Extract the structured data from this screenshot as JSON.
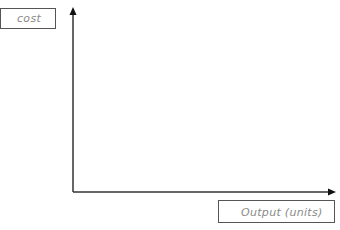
{
  "diagram": {
    "type": "blank-axes",
    "y_axis_label": "cost",
    "x_axis_label": "Output (units)",
    "axis_color": "#333333",
    "label_color": "#8a8a8a"
  }
}
